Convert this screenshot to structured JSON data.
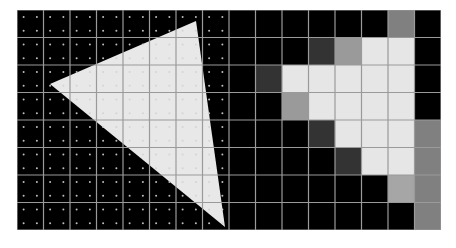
{
  "diagram": {
    "title": "",
    "grid": {
      "columns": 8,
      "rows": 8,
      "samples_per_pixel": 4
    },
    "colors": {
      "background": "#000000",
      "grid_line": "#9a9a9a",
      "triangle_fill": "#e8e8e8",
      "sample_dot": "#bdbdbd",
      "sample_dot_inside": "#d4d4d4"
    },
    "triangle": {
      "vertices": [
        [
          33,
          74
        ],
        [
          179,
          11
        ],
        [
          208,
          217
        ]
      ]
    },
    "coverage": [
      [
        "#000000",
        "#000000",
        "#000000",
        "#000000",
        "#000000",
        "#000000",
        "#808080",
        "#000000"
      ],
      [
        "#000000",
        "#000000",
        "#000000",
        "#333333",
        "#9a9a9a",
        "#e6e6e6",
        "#e6e6e6",
        "#000000"
      ],
      [
        "#000000",
        "#333333",
        "#e6e6e6",
        "#e6e6e6",
        "#e6e6e6",
        "#e6e6e6",
        "#e6e6e6",
        "#000000"
      ],
      [
        "#000000",
        "#000000",
        "#9a9a9a",
        "#e6e6e6",
        "#e6e6e6",
        "#e6e6e6",
        "#e6e6e6",
        "#000000"
      ],
      [
        "#000000",
        "#000000",
        "#000000",
        "#333333",
        "#e6e6e6",
        "#e6e6e6",
        "#e6e6e6",
        "#808080"
      ],
      [
        "#000000",
        "#000000",
        "#000000",
        "#000000",
        "#333333",
        "#e6e6e6",
        "#e6e6e6",
        "#808080"
      ],
      [
        "#000000",
        "#000000",
        "#000000",
        "#000000",
        "#000000",
        "#000000",
        "#a6a6a6",
        "#808080"
      ],
      [
        "#000000",
        "#000000",
        "#000000",
        "#000000",
        "#000000",
        "#000000",
        "#000000",
        "#808080"
      ]
    ]
  }
}
